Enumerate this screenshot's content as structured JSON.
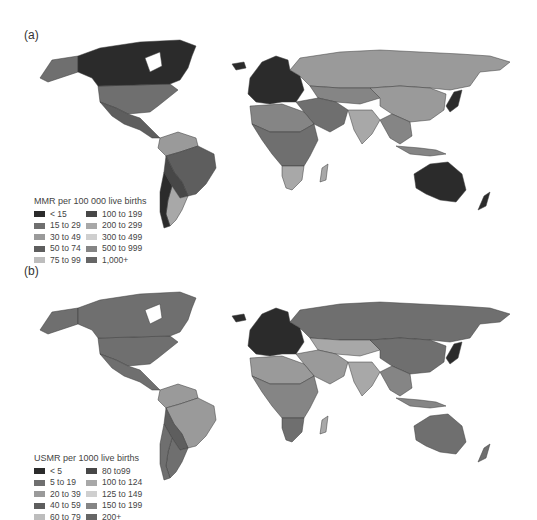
{
  "panels": [
    {
      "label": "(a)",
      "legend": {
        "title": "MMR per 100 000 live births",
        "items": [
          {
            "label": "< 15",
            "color": "#2b2b2b"
          },
          {
            "label": "15 to 29",
            "color": "#6f6f6f"
          },
          {
            "label": "30 to 49",
            "color": "#9a9a9a"
          },
          {
            "label": "50 to 74",
            "color": "#5e5e5e"
          },
          {
            "label": "75 to 99",
            "color": "#bdbdbd"
          },
          {
            "label": "100 to 199",
            "color": "#474747"
          },
          {
            "label": "200 to 299",
            "color": "#a8a8a8"
          },
          {
            "label": "300 to 499",
            "color": "#cfcfcf"
          },
          {
            "label": "500 to 999",
            "color": "#858585"
          },
          {
            "label": "1,000+",
            "color": "#666666"
          }
        ]
      },
      "regions": {
        "canada": "#2b2b2b",
        "alaska_usa": "#6f6f6f",
        "greenland": "#ffffff",
        "mexico_central": "#5e5e5e",
        "south_america_north": "#9a9a9a",
        "brazil": "#5e5e5e",
        "bolivia_paraguay": "#474747",
        "argentina": "#a8a8a8",
        "chile": "#2b2b2b",
        "europe": "#2b2b2b",
        "russia": "#9a9a9a",
        "central_asia": "#858585",
        "china": "#9a9a9a",
        "middle_east": "#6f6f6f",
        "india": "#a8a8a8",
        "southeast_asia": "#858585",
        "japan": "#2b2b2b",
        "north_africa": "#858585",
        "sub_saharan_africa": "#6f6f6f",
        "southern_africa": "#a8a8a8",
        "madagascar": "#a8a8a8",
        "australia": "#2b2b2b",
        "new_zealand": "#2b2b2b",
        "indonesia": "#858585",
        "iceland": "#2b2b2b"
      }
    },
    {
      "label": "(b)",
      "legend": {
        "title": "USMR per 1000 live births",
        "items": [
          {
            "label": "< 5",
            "color": "#2b2b2b"
          },
          {
            "label": "5 to 19",
            "color": "#6f6f6f"
          },
          {
            "label": "20 to 39",
            "color": "#9a9a9a"
          },
          {
            "label": "40 to 59",
            "color": "#5e5e5e"
          },
          {
            "label": "60 to 79",
            "color": "#bdbdbd"
          },
          {
            "label": "80 to99",
            "color": "#474747"
          },
          {
            "label": "100 to 124",
            "color": "#a8a8a8"
          },
          {
            "label": "125 to 149",
            "color": "#cfcfcf"
          },
          {
            "label": "150 to 199",
            "color": "#858585"
          },
          {
            "label": "200+",
            "color": "#666666"
          }
        ]
      },
      "regions": {
        "canada": "#6f6f6f",
        "alaska_usa": "#6f6f6f",
        "greenland": "#ffffff",
        "mexico_central": "#6f6f6f",
        "south_america_north": "#9a9a9a",
        "brazil": "#9a9a9a",
        "bolivia_paraguay": "#5e5e5e",
        "argentina": "#6f6f6f",
        "chile": "#6f6f6f",
        "europe": "#2b2b2b",
        "russia": "#6f6f6f",
        "central_asia": "#a8a8a8",
        "china": "#6f6f6f",
        "middle_east": "#9a9a9a",
        "india": "#a8a8a8",
        "southeast_asia": "#858585",
        "japan": "#2b2b2b",
        "north_africa": "#9a9a9a",
        "sub_saharan_africa": "#858585",
        "southern_africa": "#6f6f6f",
        "madagascar": "#a8a8a8",
        "australia": "#6f6f6f",
        "new_zealand": "#6f6f6f",
        "indonesia": "#858585",
        "iceland": "#2b2b2b"
      }
    }
  ]
}
